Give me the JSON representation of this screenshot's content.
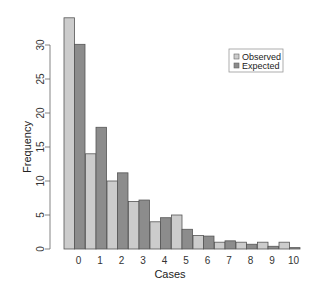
{
  "chart_data": {
    "type": "bar",
    "title": "",
    "xlabel": "Cases",
    "ylabel": "Frequency",
    "categories": [
      "0",
      "1",
      "2",
      "3",
      "4",
      "5",
      "6",
      "7",
      "8",
      "9",
      "10"
    ],
    "series": [
      {
        "name": "Observed",
        "color": "#cccccc",
        "values": [
          34,
          14,
          10,
          7,
          4,
          5,
          2,
          1,
          1,
          1,
          1
        ]
      },
      {
        "name": "Expected",
        "color": "#8c8c8c",
        "values": [
          30.1,
          17.9,
          11.2,
          7.2,
          4.6,
          2.9,
          1.9,
          1.2,
          0.7,
          0.4,
          0.2
        ]
      }
    ],
    "ylim": [
      0,
      34
    ],
    "yticks": [
      0,
      5,
      10,
      15,
      20,
      25,
      30
    ],
    "grid": false,
    "legend": {
      "position": "top-right",
      "entries": [
        "Observed",
        "Expected"
      ]
    },
    "bar_border_color": "#555555"
  }
}
